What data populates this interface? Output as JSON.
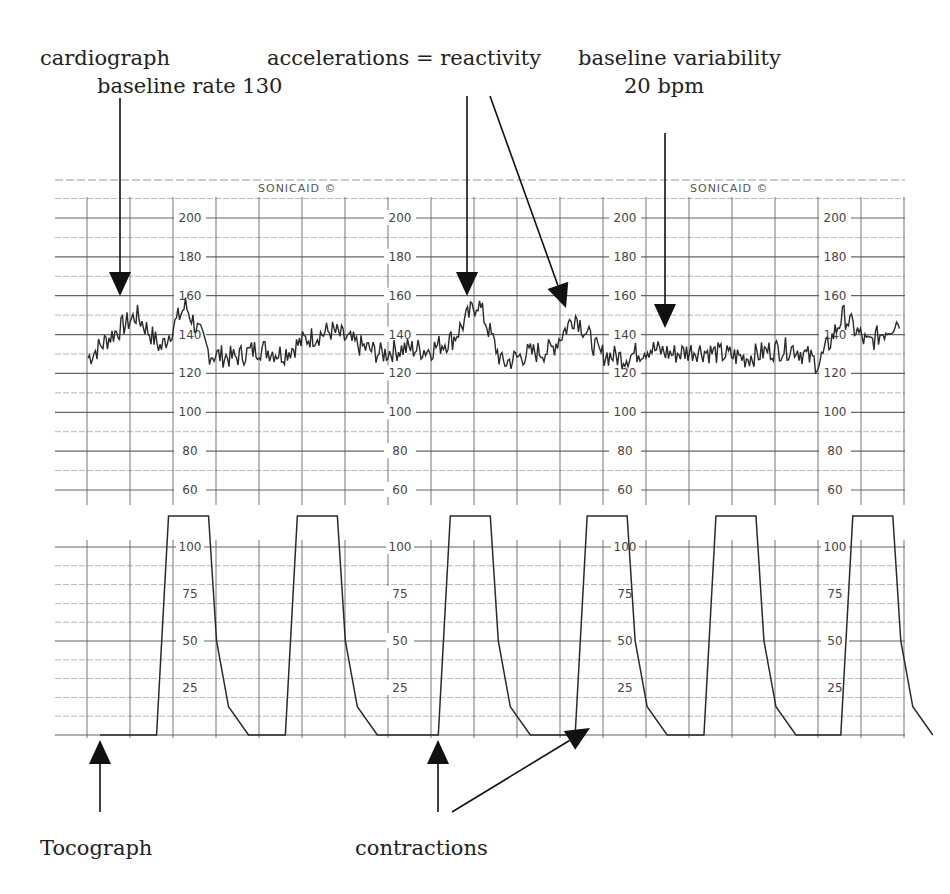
{
  "annotations": {
    "cardiograph": "cardiograph",
    "baseline_rate": "baseline rate 130",
    "accelerations": "accelerations = reactivity",
    "baseline_variability_line1": "baseline variability",
    "baseline_variability_line2": "20 bpm",
    "tocograph": "Tocograph",
    "contractions": "contractions"
  },
  "strip": {
    "brand_labels": [
      "SONICAID ©",
      "SONICAID ©"
    ],
    "fhr_scale": [
      "200",
      "180",
      "160",
      "140",
      "120",
      "100",
      "80",
      "60"
    ],
    "toco_scale": [
      "100",
      "75",
      "50",
      "25"
    ],
    "scale_label_x": [
      190,
      400,
      625,
      835
    ]
  },
  "colors": {
    "trace": "#2a2a2a",
    "grid": "#555555",
    "arrow": "#111111",
    "background": "#ffffff"
  },
  "chart_data": [
    {
      "type": "line",
      "title": "Cardiograph (fetal heart rate)",
      "ylabel": "bpm",
      "ylim": [
        60,
        200
      ],
      "yticks": [
        60,
        80,
        100,
        120,
        140,
        160,
        180,
        200
      ],
      "baseline_bpm": 130,
      "baseline_variability_bpm": 20,
      "accelerations_peaks_bpm": [
        155,
        156,
        152,
        150
      ],
      "trace_approx": {
        "x_frac": [
          0.0,
          0.03,
          0.06,
          0.09,
          0.12,
          0.15,
          0.18,
          0.21,
          0.24,
          0.27,
          0.3,
          0.33,
          0.36,
          0.39,
          0.42,
          0.45,
          0.48,
          0.51,
          0.54,
          0.57,
          0.6,
          0.63,
          0.66,
          0.69,
          0.72,
          0.75,
          0.78,
          0.81,
          0.84,
          0.87,
          0.9,
          0.93,
          0.96,
          1.0
        ],
        "bpm": [
          128,
          140,
          150,
          133,
          155,
          130,
          128,
          133,
          130,
          138,
          142,
          135,
          130,
          133,
          132,
          138,
          157,
          125,
          130,
          132,
          150,
          130,
          128,
          133,
          130,
          132,
          130,
          128,
          132,
          133,
          125,
          150,
          135,
          148
        ]
      }
    },
    {
      "type": "line",
      "title": "Tocograph (uterine contractions)",
      "ylim": [
        0,
        100
      ],
      "yticks": [
        25,
        50,
        75,
        100
      ],
      "contraction_count": 6,
      "contraction_peaks": [
        110,
        110,
        110,
        110,
        110,
        110
      ],
      "contraction_center_x_frac": [
        0.11,
        0.27,
        0.46,
        0.63,
        0.79,
        0.96
      ]
    }
  ]
}
